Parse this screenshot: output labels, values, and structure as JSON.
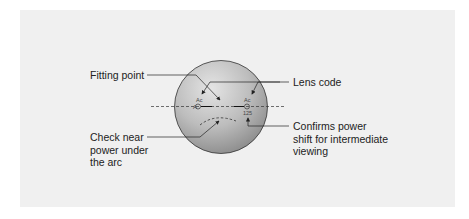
{
  "diagram": {
    "labels": {
      "fitting_point": "Fitting point",
      "lens_code": "Lens code",
      "check_near": [
        "Check near",
        "power under",
        "the arc"
      ],
      "confirms": [
        "Confirms power",
        "shift for intermediate",
        "viewing"
      ]
    },
    "lens_marks": {
      "left_ac": "Ac",
      "left_a": "A",
      "right_ac": "Ac",
      "right_number": "125"
    }
  }
}
